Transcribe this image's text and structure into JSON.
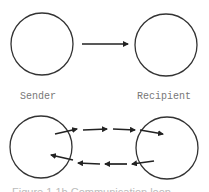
{
  "diagram": {
    "labels": {
      "sender": "Sender",
      "recipient": "Recipient"
    },
    "caption_partial": "Figure 1.1b  Communication loop",
    "colors": {
      "stroke": "#333333",
      "label": "#777777",
      "background": "#ffffff"
    },
    "top_model": {
      "type": "one-way",
      "nodes": [
        "Sender",
        "Recipient"
      ],
      "arrows": 1
    },
    "bottom_model": {
      "type": "two-way",
      "nodes": [
        "Sender",
        "Recipient"
      ],
      "forward_arrows": 4,
      "return_arrows": 4
    }
  }
}
